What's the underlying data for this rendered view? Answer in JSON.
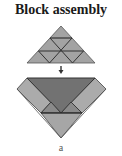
{
  "figure": {
    "title": "Block assembly",
    "label": "a"
  },
  "colors": {
    "light_gray": "#a9a9a9",
    "medium_gray": "#8c8c8c",
    "dark_gray": "#6f6f6f",
    "line": "#222222",
    "arrow": "#333333"
  },
  "diagram": {
    "top_shape": "triangle subdivided into 9 smaller triangles (3 rows)",
    "arrow": "down-arrow",
    "bottom_shape": "assembled block: dark inverted triangle center, light diagonal side bands, light bottom triangle"
  }
}
